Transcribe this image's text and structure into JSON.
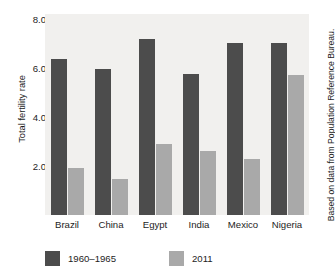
{
  "caption_sliver": "",
  "chart_data": {
    "type": "bar",
    "title": "",
    "subtitle": "",
    "xlabel": "",
    "ylabel": "Total fertility rate",
    "ylim": [
      0,
      8.2
    ],
    "yticks": [
      2.0,
      4.0,
      6.0,
      8.0
    ],
    "ytick_labels": [
      "2.0",
      "4.0",
      "6.0",
      "8.0"
    ],
    "grid": false,
    "legend_position": "bottom-left",
    "plot_background": "#f1f0ee",
    "categories": [
      "Brazil",
      "China",
      "Egypt",
      "India",
      "Mexico",
      "Nigeria"
    ],
    "series": [
      {
        "name": "1960–1965",
        "color": "#4c4c4c",
        "values": [
          6.35,
          5.95,
          7.2,
          5.75,
          7.0,
          7.0
        ]
      },
      {
        "name": "2011",
        "color": "#a9a9a9",
        "values": [
          1.9,
          1.45,
          2.9,
          2.6,
          2.3,
          5.7
        ]
      }
    ],
    "annotations": [
      "Based on data from Population Reference Bureau."
    ]
  },
  "source_credit": "Based on data from Population Reference Bureau."
}
